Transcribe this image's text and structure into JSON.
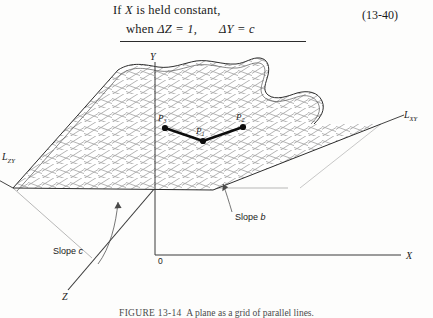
{
  "equation": {
    "line1_pre": "If ",
    "line1_var": "X",
    "line1_post": " is held constant,",
    "line2_pre": "when ",
    "line2_expr1": "ΔZ = 1,",
    "line2_expr2": "ΔY = c",
    "number": "(13-40)"
  },
  "figure": {
    "caption_number": "FIGURE 13-14",
    "caption_text": "A plane as a grid of parallel lines.",
    "axes": [
      {
        "id": "y-axis",
        "label": "Y"
      },
      {
        "id": "x-axis",
        "label": "X"
      },
      {
        "id": "z-axis",
        "label": "Z"
      }
    ],
    "origin_label": "0",
    "trace_lines": [
      {
        "id": "l-zy",
        "label": "L",
        "sub": "ZY"
      },
      {
        "id": "l-xy",
        "label": "L",
        "sub": "XY"
      }
    ],
    "points": [
      {
        "id": "p3",
        "label": "P",
        "sub": "3",
        "x": 165,
        "y": 76
      },
      {
        "id": "p1",
        "label": "P",
        "sub": "1",
        "x": 203,
        "y": 89
      },
      {
        "id": "p2",
        "label": "P",
        "sub": "2",
        "x": 243,
        "y": 75
      }
    ],
    "callouts": [
      {
        "id": "slope-c",
        "text_pre": "Slope ",
        "text_var": "c"
      },
      {
        "id": "slope-b",
        "text_pre": "Slope ",
        "text_var": "b"
      }
    ],
    "colors": {
      "ink": "#1a1a1a",
      "grid": "#9a9a9a",
      "axis": "#3a3a3a",
      "thin": "#8d8d8d",
      "plane_fill": "#ffffff"
    }
  }
}
